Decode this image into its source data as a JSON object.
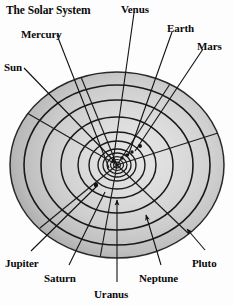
{
  "diagram": {
    "title": "The Solar System",
    "title_pos": {
      "x": 6,
      "y": 6
    },
    "canvas": {
      "width": 233,
      "height": 306
    },
    "colors": {
      "background": "#fdfdfd",
      "orbit_line": "#1a1a1a",
      "leader_line": "#111111",
      "label_text": "#0a0a0a",
      "disk_center": "#e9e9e9",
      "disk_mid": "#cfcfcf",
      "disk_rim": "#9a9a9a",
      "disk_edge": "#8a8a8a",
      "planet_dot": "#141414"
    },
    "disk": {
      "cx": 117,
      "cy": 165,
      "rx": 107,
      "ry": 93
    },
    "orbits": [
      {
        "name": "Mercury",
        "rx": 6,
        "ry": 5
      },
      {
        "name": "Venus",
        "rx": 10,
        "ry": 8
      },
      {
        "name": "Earth",
        "rx": 14,
        "ry": 12
      },
      {
        "name": "Mars",
        "rx": 19,
        "ry": 16
      },
      {
        "name": "Jupiter",
        "rx": 28,
        "ry": 24
      },
      {
        "name": "Saturn",
        "rx": 39,
        "ry": 33
      },
      {
        "name": "Uranus",
        "rx": 56,
        "ry": 48
      },
      {
        "name": "Neptune",
        "rx": 76,
        "ry": 65
      },
      {
        "name": "Pluto",
        "rx": 93,
        "ry": 80
      },
      {
        "name": "Rim",
        "rx": 107,
        "ry": 93
      }
    ],
    "planet_dots": [
      {
        "name": "mercury-dot",
        "cx": 113,
        "cy": 161,
        "r": 1.5
      },
      {
        "name": "venus-dot",
        "cx": 122,
        "cy": 158,
        "r": 1.7
      },
      {
        "name": "earth-dot",
        "cx": 126,
        "cy": 155,
        "r": 1.8
      },
      {
        "name": "mars-dot",
        "cx": 131,
        "cy": 152,
        "r": 1.7
      },
      {
        "name": "jupiter-dot",
        "cx": 96,
        "cy": 184,
        "r": 2.2
      },
      {
        "name": "saturn-dot",
        "cx": 140,
        "cy": 145,
        "r": 2.0
      }
    ],
    "labels": [
      {
        "id": "sun",
        "text": "Sun",
        "x": 4,
        "y": 62,
        "anchor": "start"
      },
      {
        "id": "mercury",
        "text": "Mercury",
        "x": 21,
        "y": 30,
        "anchor": "start"
      },
      {
        "id": "venus",
        "text": "Venus",
        "x": 122,
        "y": 5,
        "anchor": "start"
      },
      {
        "id": "earth",
        "text": "Earth",
        "x": 167,
        "y": 24,
        "anchor": "start"
      },
      {
        "id": "mars",
        "text": "Mars",
        "x": 197,
        "y": 41,
        "anchor": "start"
      },
      {
        "id": "jupiter",
        "text": "Jupiter",
        "x": 6,
        "y": 259,
        "anchor": "start"
      },
      {
        "id": "saturn",
        "text": "Saturn",
        "x": 44,
        "y": 274,
        "anchor": "start"
      },
      {
        "id": "uranus",
        "text": "Uranus",
        "x": 95,
        "y": 290,
        "anchor": "start"
      },
      {
        "id": "neptune",
        "text": "Neptune",
        "x": 140,
        "y": 274,
        "anchor": "start"
      },
      {
        "id": "pluto",
        "text": "Pluto",
        "x": 193,
        "y": 259,
        "anchor": "start"
      }
    ],
    "leader_lines": [
      {
        "id": "sun-leader",
        "x1": 24,
        "y1": 68,
        "x2": 116,
        "y2": 164,
        "arrow": false
      },
      {
        "id": "mercury-leader",
        "x1": 55,
        "y1": 35,
        "x2": 108,
        "y2": 168,
        "arrow": false
      },
      {
        "id": "venus-leader",
        "x1": 134,
        "y1": 12,
        "x2": 113,
        "y2": 163,
        "arrow": false
      },
      {
        "id": "earth-leader",
        "x1": 172,
        "y1": 31,
        "x2": 127,
        "y2": 157,
        "arrow": false
      },
      {
        "id": "mars-leader",
        "x1": 203,
        "y1": 48,
        "x2": 134,
        "y2": 152,
        "arrow": false
      },
      {
        "id": "jupiter-leader",
        "x1": 30,
        "y1": 252,
        "x2": 96,
        "y2": 185,
        "arrow": false
      },
      {
        "id": "saturn-leader",
        "x1": 68,
        "y1": 266,
        "x2": 104,
        "y2": 191,
        "arrow": false
      },
      {
        "id": "uranus-leader",
        "x1": 117,
        "y1": 283,
        "x2": 117,
        "y2": 199,
        "arrow": true
      },
      {
        "id": "neptune-leader",
        "x1": 160,
        "y1": 266,
        "x2": 145,
        "y2": 214,
        "arrow": true
      },
      {
        "id": "pluto-leader",
        "x1": 204,
        "y1": 251,
        "x2": 186,
        "y2": 228,
        "arrow": true
      }
    ],
    "radial_spokes": [
      {
        "id": "spoke-upper-left",
        "angle": 212
      },
      {
        "id": "spoke-upper-mid",
        "angle": 250
      },
      {
        "id": "spoke-upper-right",
        "angle": 300
      },
      {
        "id": "spoke-right",
        "angle": 340
      },
      {
        "id": "spoke-lower-left",
        "angle": 150
      },
      {
        "id": "spoke-lower-mid",
        "angle": 100
      },
      {
        "id": "spoke-lower-right",
        "angle": 55
      }
    ]
  }
}
